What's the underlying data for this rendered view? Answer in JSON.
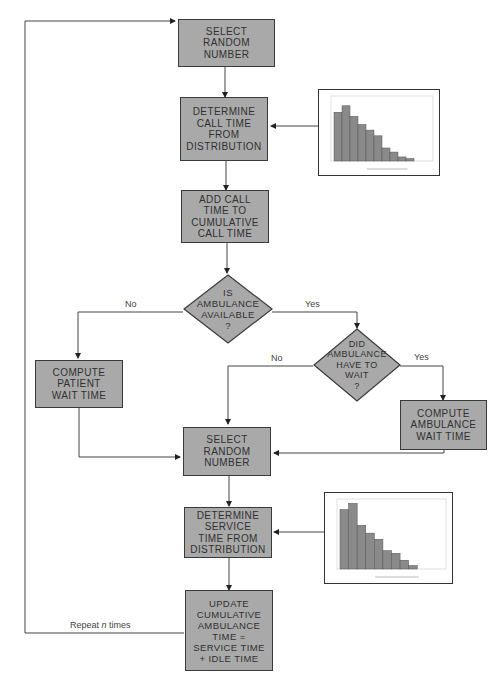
{
  "nodes": {
    "select1": "SELECT\nRANDOM\nNUMBER",
    "determine_call": "DETERMINE\nCALL TIME\nFROM\nDISTRIBUTION",
    "add_call": "ADD CALL\nTIME TO\nCUMULATIVE\nCALL TIME",
    "is_available": "IS\nAMBULANCE\nAVAILABLE\n?",
    "did_wait": "DID\nAMBULANCE\nHAVE TO\nWAIT\n?",
    "patient_wait": "COMPUTE\nPATIENT\nWAIT TIME",
    "ambulance_wait": "COMPUTE\nAMBULANCE\nWAIT TIME",
    "select2": "SELECT\nRANDOM\nNUMBER",
    "determine_service": "DETERMINE\nSERVICE\nTIME FROM\nDISTRIBUTION",
    "update": "UPDATE\nCUMULATIVE\nAMBULANCE\nTIME =\nSERVICE TIME\n+ IDLE TIME"
  },
  "labels": {
    "no1": "No",
    "yes1": "Yes",
    "no2": "No",
    "yes2": "Yes",
    "repeat_prefix": "Repeat ",
    "repeat_n": "n",
    "repeat_suffix": " times"
  },
  "chart_data": [
    {
      "type": "bar",
      "title": "",
      "description": "Call time distribution histogram",
      "values": [
        60,
        68,
        55,
        45,
        38,
        31,
        16,
        11,
        5,
        3,
        0,
        0
      ],
      "ylim": [
        0,
        80
      ]
    },
    {
      "type": "bar",
      "title": "",
      "description": "Service time distribution histogram",
      "values": [
        68,
        75,
        50,
        41,
        34,
        21,
        18,
        10,
        4,
        0,
        0,
        0
      ],
      "ylim": [
        0,
        80
      ]
    }
  ]
}
